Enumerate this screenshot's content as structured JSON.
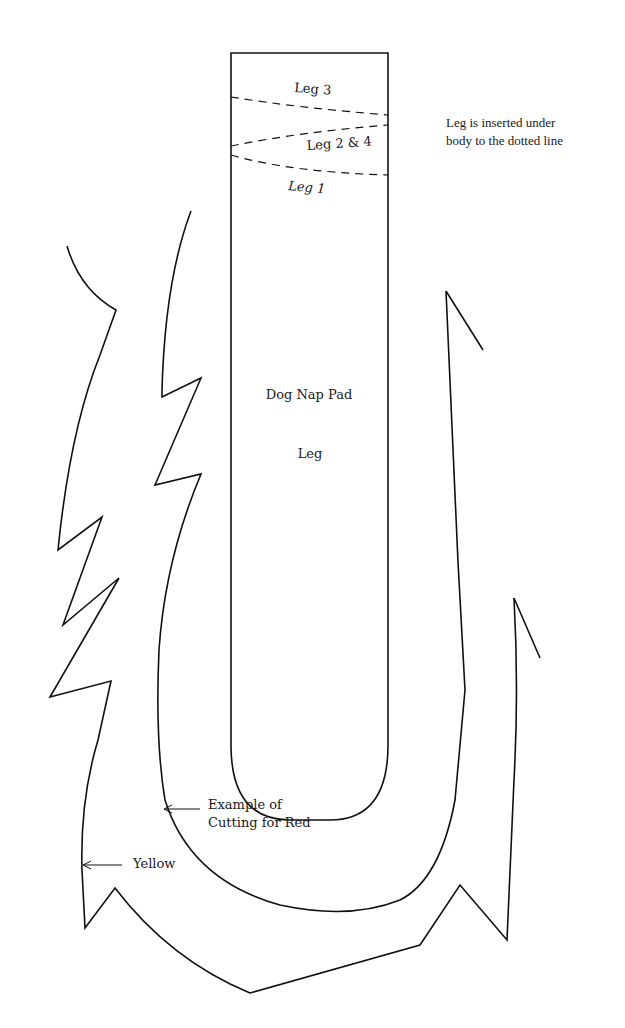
{
  "diagram": {
    "title": "Dog Nap Pad",
    "pattern_piece": "Leg",
    "leg_lines": {
      "leg3": "Leg 3",
      "leg24": "Leg 2 & 4",
      "leg1": "Leg 1"
    },
    "note": {
      "line1": "Leg is inserted under",
      "line2": "body to the dotted line"
    },
    "callouts": {
      "red_line1": "Example of",
      "red_line2": "Cutting for Red",
      "yellow": "Yellow"
    },
    "colors": {
      "stroke": "#111111",
      "background": "#ffffff"
    }
  }
}
